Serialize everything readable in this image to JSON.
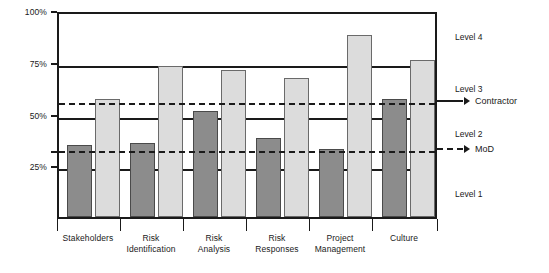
{
  "chart_data": {
    "type": "bar",
    "title": "",
    "xlabel": "",
    "ylabel": "",
    "ylim": [
      0,
      100
    ],
    "y_tick_labels": [
      "25%",
      "50%",
      "75%",
      "100%"
    ],
    "y_tick_values": [
      25,
      50,
      75,
      100
    ],
    "grid": true,
    "legend_position": "right",
    "categories": [
      "Stakeholders",
      "Risk\nIdentification",
      "Risk\nAnalysis",
      "Risk\nResponses",
      "Project\nManagement",
      "Culture"
    ],
    "series": [
      {
        "name": "dark",
        "color": "#8c8c8c",
        "values": [
          35,
          36,
          51,
          38,
          33,
          57
        ]
      },
      {
        "name": "light",
        "color": "#dcdcdc",
        "values": [
          57,
          73,
          71,
          67,
          88,
          76
        ]
      }
    ],
    "reference_lines": [
      {
        "label": "Contractor",
        "value": 57,
        "style": "dashed"
      },
      {
        "label": "MoD",
        "value": 34,
        "style": "dashed"
      }
    ],
    "bands": [
      {
        "label": "Level 1",
        "from": 0,
        "to": 25,
        "label_at": 12
      },
      {
        "label": "Level 2",
        "from": 25,
        "to": 50,
        "label_at": 41
      },
      {
        "label": "Level 3",
        "from": 50,
        "to": 75,
        "label_at": 63
      },
      {
        "label": "Level 4",
        "from": 75,
        "to": 100,
        "label_at": 88
      }
    ],
    "band_lines": [
      25,
      50,
      75
    ]
  },
  "axis": {
    "tick_100": "100%",
    "tick_75": "75%",
    "tick_50": "50%",
    "tick_25": "25%"
  },
  "categories": {
    "c0": "Stakeholders",
    "c1": "Risk\nIdentification",
    "c2": "Risk\nAnalysis",
    "c3": "Risk\nResponses",
    "c4": "Project\nManagement",
    "c5": "Culture"
  },
  "levels": {
    "l1": "Level 1",
    "l2": "Level 2",
    "l3": "Level 3",
    "l4": "Level 4"
  },
  "legend": {
    "contractor": "Contractor",
    "mod": "MoD"
  }
}
